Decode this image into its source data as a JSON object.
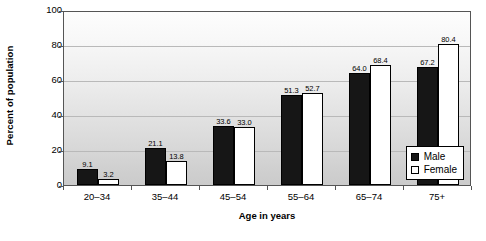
{
  "chart_data": {
    "type": "bar",
    "title": "",
    "xlabel": "Age in years",
    "ylabel": "Percent of population",
    "categories": [
      "20–34",
      "35–44",
      "45–54",
      "55–64",
      "65–74",
      "75+"
    ],
    "series": [
      {
        "name": "Male",
        "values": [
          9.1,
          21.1,
          33.6,
          51.3,
          64.0,
          67.2
        ]
      },
      {
        "name": "Female",
        "values": [
          3.2,
          13.8,
          33.0,
          52.7,
          68.4,
          80.4
        ]
      }
    ],
    "value_labels": {
      "male": [
        "9.1",
        "21.1",
        "33.6",
        "51.3",
        "64.0",
        "67.2"
      ],
      "female": [
        "3.2",
        "13.8",
        "33.0",
        "52.7",
        "68.4",
        "80.4"
      ]
    },
    "ylim": [
      0,
      100
    ],
    "yticks": [
      "0",
      "20",
      "40",
      "60",
      "80",
      "100"
    ],
    "grid": true,
    "legend_position": "inside-bottom-right",
    "legend": [
      "Male",
      "Female"
    ],
    "colors": {
      "male": "#161616",
      "female": "#ffffff",
      "outline": "#000000",
      "gridline": "#b9b9b9",
      "frame": "#555555"
    }
  }
}
